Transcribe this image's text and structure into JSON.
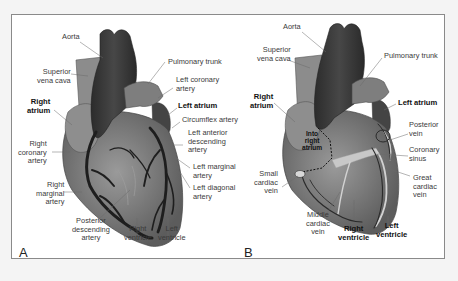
{
  "figure": {
    "panels": [
      {
        "letter": "A",
        "subject": "Anterior view of heart with coronary arteries",
        "labels": {
          "aorta": "Aorta",
          "svc_1": "Superior",
          "svc_2": "vena cava",
          "right_atrium_1": "Right",
          "right_atrium_2": "atrium",
          "rca_1": "Right",
          "rca_2": "coronary",
          "rca_3": "artery",
          "rma_1": "Right",
          "rma_2": "marginal",
          "rma_3": "artery",
          "pda_1": "Posterior",
          "pda_2": "descending",
          "pda_3": "artery",
          "rv_1": "Right",
          "rv_2": "ventricle",
          "lv_1": "Left",
          "lv_2": "ventricle",
          "pulm": "Pulmonary trunk",
          "lca_1": "Left coronary",
          "lca_2": "artery",
          "left_atrium": "Left atrium",
          "circ": "Circumflex artery",
          "lad_1": "Left anterior",
          "lad_2": "descending",
          "lad_3": "artery",
          "lma_1": "Left marginal",
          "lma_2": "artery",
          "ldiag_1": "Left diagonal",
          "ldiag_2": "artery"
        }
      },
      {
        "letter": "B",
        "subject": "Anterior view of heart with cardiac veins",
        "labels": {
          "aorta": "Aorta",
          "svc_1": "Superior",
          "svc_2": "vena cava",
          "right_atrium_1": "Right",
          "right_atrium_2": "atrium",
          "into_1": "Into",
          "into_2": "right",
          "into_3": "atrium",
          "scv_1": "Small",
          "scv_2": "cardiac",
          "scv_3": "vein",
          "mcv_1": "Middle",
          "mcv_2": "cardiac",
          "mcv_3": "vein",
          "rv_1": "Right",
          "rv_2": "ventricle",
          "lv_1": "Left",
          "lv_2": "ventricle",
          "pulm": "Pulmonary trunk",
          "left_atrium": "Left atrium",
          "pv_1": "Posterior",
          "pv_2": "vein",
          "cs_1": "Coronary",
          "cs_2": "sinus",
          "gcv_1": "Great",
          "gcv_2": "cardiac",
          "gcv_3": "vein"
        }
      }
    ],
    "colors": {
      "background": "#f4f4f4",
      "frame_fill": "#ffffff",
      "frame_border": "#8a8a8a",
      "great_vessels": "#3c3c3c",
      "heart_body": "#7a7a7a",
      "atria": "#8e8e8e",
      "arteries": "#1e1e1e",
      "veins_light": "#c8c8c8",
      "leader_lines": "#6a6a6a"
    }
  }
}
